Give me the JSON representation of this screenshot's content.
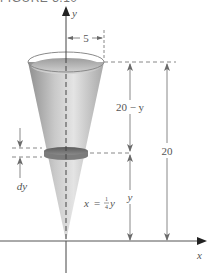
{
  "figure": {
    "header_partial": "FIGURE 3.10"
  },
  "axes": {
    "x_label": "x",
    "y_label": "y"
  },
  "dimensions": {
    "radius_label": "5",
    "upper_height_label": "20 − y",
    "lower_height_label": "y",
    "total_height_label": "20",
    "slice_thickness_label": "dy"
  },
  "equation": {
    "lhs": "x",
    "eq": "=",
    "frac_num": "1",
    "frac_den": "4",
    "var": "y"
  },
  "colors": {
    "cone_light": "#e2e2e2",
    "cone_dark": "#9a9a9a",
    "water": "#b5b5b5",
    "slice": "#6e6e6e",
    "line": "#6a6a6a",
    "axis": "#555555"
  }
}
